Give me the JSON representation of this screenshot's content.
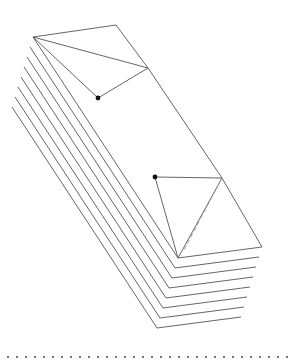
{
  "figure": {
    "stroke_color": "#555555",
    "dot_color": "#111111",
    "dash_color": "#999999",
    "layer_count": 8,
    "layer_offset": {
      "dx": -3,
      "dy": 10
    },
    "top_sheet": {
      "apex": [
        33,
        37
      ],
      "top_corner": [
        116,
        25
      ],
      "fold_corner": [
        148,
        68
      ],
      "right_corner": [
        222,
        178
      ],
      "dot_upper": [
        98,
        98
      ],
      "dot_lower": [
        155,
        177
      ],
      "bottom_vertex": [
        178,
        258
      ],
      "bottom_right": [
        262,
        247
      ]
    },
    "dotted_rule": {
      "y": 357,
      "x_start": 8,
      "x_end": 287,
      "spacing": 9
    }
  }
}
